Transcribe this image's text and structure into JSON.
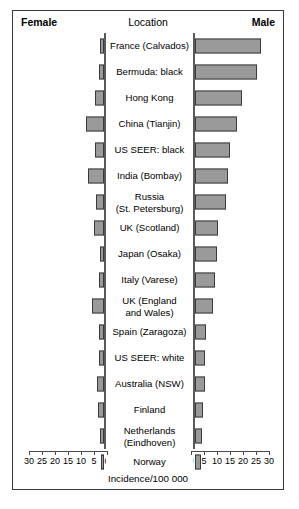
{
  "header": {
    "female_label": "Female",
    "location_label": "Location",
    "male_label": "Male"
  },
  "axis": {
    "title": "Incidence/100 000",
    "left_ticks": [
      "30",
      "25",
      "20",
      "15",
      "10",
      "5",
      "0"
    ],
    "right_ticks": [
      "0",
      "5",
      "10",
      "15",
      "20",
      "25",
      "30"
    ]
  },
  "colors": {
    "bar_fill": "#9a9a9a",
    "bar_stroke": "#3a3a3a",
    "frame": "#3b3b3b",
    "baseline": "#5a5a5a"
  },
  "chart_data": {
    "type": "bar",
    "title": "",
    "subtitle": "",
    "xlabel": "Incidence/100 000",
    "ylabel": "Location",
    "orientation": "horizontal",
    "layout": "population-pyramid",
    "grid": false,
    "legend": "none",
    "xlim_left": [
      30,
      0
    ],
    "xlim_right": [
      0,
      30
    ],
    "categories": [
      "France (Calvados)",
      "Bermuda: black",
      "Hong Kong",
      "China (Tianjin)",
      "US SEER: black",
      "India (Bombay)",
      "Russia\n(St. Petersburg)",
      "UK (Scotland)",
      "Japan (Osaka)",
      "Italy (Varese)",
      "UK (England\nand Wales)",
      "Spain (Zaragoza)",
      "US SEER: white",
      "Australia (NSW)",
      "Finland",
      "Netherlands\n(Eindhoven)",
      "Norway"
    ],
    "series": [
      {
        "name": "Female",
        "side": "left",
        "values": [
          1.6,
          1.8,
          3.6,
          7.0,
          3.4,
          6.0,
          3.2,
          3.8,
          1.4,
          2.0,
          4.6,
          1.9,
          2.0,
          2.6,
          2.4,
          1.6,
          1.2
        ]
      },
      {
        "name": "Male",
        "side": "right",
        "values": [
          25.5,
          24.0,
          18.0,
          16.0,
          13.5,
          12.5,
          12.0,
          9.0,
          8.6,
          7.8,
          7.0,
          4.4,
          4.0,
          3.8,
          3.2,
          2.8,
          2.4
        ]
      }
    ]
  }
}
